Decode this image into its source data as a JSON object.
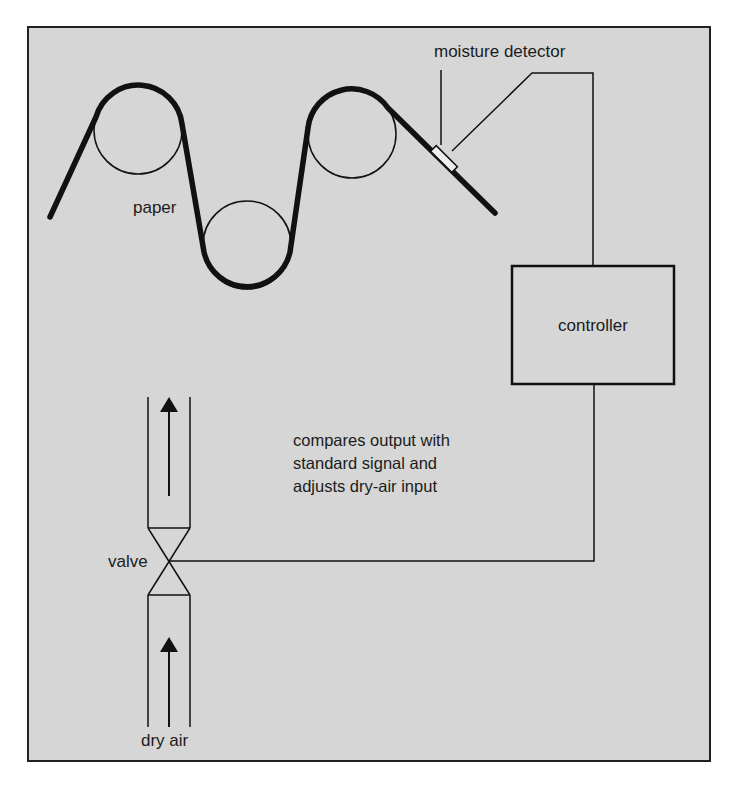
{
  "caption_fragment": "moisture detector system — top caption clipped (unreadable)",
  "colors": {
    "panel_fill": "#d6d6d6",
    "stroke": "#111111",
    "text": "#1c1c1c",
    "detector_fill": "#eeeeee"
  },
  "labels": {
    "moisture_detector": "moisture detector",
    "paper": "paper",
    "controller": "controller",
    "description_line1": "compares output with",
    "description_line2": "standard signal and",
    "description_line3": "adjusts dry-air input",
    "valve": "valve",
    "dry_air": "dry air"
  },
  "components": {
    "rollers": [
      {
        "name": "roller-1",
        "cx": 138,
        "cy": 130,
        "r": 44
      },
      {
        "name": "roller-2",
        "cx": 247,
        "cy": 245,
        "r": 44
      },
      {
        "name": "roller-3",
        "cx": 352,
        "cy": 134,
        "r": 44
      }
    ],
    "flow_arrows": [
      "up",
      "up"
    ]
  }
}
